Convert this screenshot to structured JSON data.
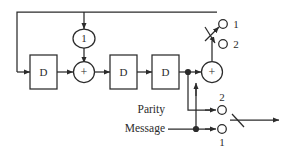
{
  "figure": {
    "type": "block-diagram",
    "background_color": "#ffffff",
    "line_color": "#2b2b2b",
    "text_color": "#2b2b2b"
  },
  "blocks": {
    "delay_1": {
      "label": "D",
      "name": "delay-element-1"
    },
    "delay_2": {
      "label": "D",
      "name": "delay-element-2"
    },
    "delay_3": {
      "label": "D",
      "name": "delay-element-3"
    },
    "gain": {
      "label": "1",
      "name": "gain-block"
    },
    "adder_left": {
      "label": "+",
      "name": "adder-left"
    },
    "adder_right": {
      "label": "+",
      "name": "adder-right"
    }
  },
  "signals": {
    "parity": "Parity",
    "message": "Message"
  },
  "switch_top": {
    "name": "output-selector-switch",
    "terminal_1": "1",
    "terminal_2": "2"
  },
  "switch_bottom": {
    "name": "input-selector-switch",
    "terminal_1": "1",
    "terminal_2": "2"
  }
}
